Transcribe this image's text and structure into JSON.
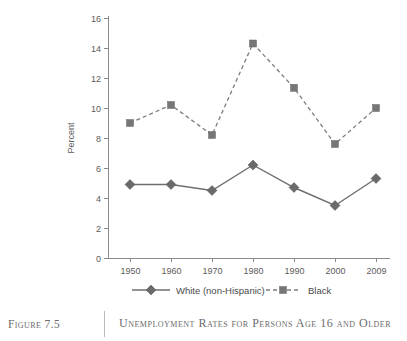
{
  "caption": {
    "figure_label": "Figure 7.5",
    "title": "Unemployment Rates for Persons Age 16 and Older"
  },
  "chart_data": {
    "type": "line",
    "title": "Unemployment Rates for Persons Age 16 and Older",
    "xlabel": "",
    "ylabel": "Percent",
    "categories": [
      "1950",
      "1960",
      "1970",
      "1980",
      "1990",
      "2000",
      "2009"
    ],
    "ylim": [
      0,
      16
    ],
    "ytick_step": 2,
    "yticks": [
      "0",
      "2",
      "4",
      "6",
      "8",
      "10",
      "12",
      "14",
      "16"
    ],
    "grid": false,
    "legend_position": "bottom",
    "series": [
      {
        "name": "White (non-Hispanic)",
        "marker": "diamond",
        "linestyle": "solid",
        "color": "#6a6a6a",
        "values": [
          4.9,
          4.9,
          4.5,
          6.2,
          4.7,
          3.5,
          5.3
        ]
      },
      {
        "name": "Black",
        "marker": "square",
        "linestyle": "dashed",
        "color": "#767676",
        "values": [
          9.0,
          10.2,
          8.2,
          14.3,
          11.35,
          7.6,
          10.0
        ]
      }
    ]
  },
  "colors": {
    "axis": "#8a8a8a",
    "text": "#5b5b5b",
    "caption_text": "#6b6b6b"
  }
}
